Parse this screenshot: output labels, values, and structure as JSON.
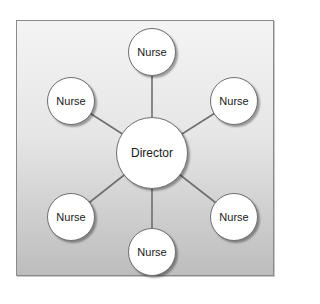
{
  "diagram": {
    "type": "hub-and-spoke organization chart",
    "center": {
      "label": "Director"
    },
    "spokes": [
      {
        "label": "Nurse",
        "position": "top"
      },
      {
        "label": "Nurse",
        "position": "upper-right"
      },
      {
        "label": "Nurse",
        "position": "lower-right"
      },
      {
        "label": "Nurse",
        "position": "bottom"
      },
      {
        "label": "Nurse",
        "position": "lower-left"
      },
      {
        "label": "Nurse",
        "position": "upper-left"
      }
    ],
    "colors": {
      "frame_border": "#8a8a8a",
      "background_top": "#f4f4f4",
      "background_bottom": "#bdbdbd",
      "node_fill": "#ffffff",
      "node_border": "#6f6f6f",
      "link": "#6f6f6f"
    }
  }
}
